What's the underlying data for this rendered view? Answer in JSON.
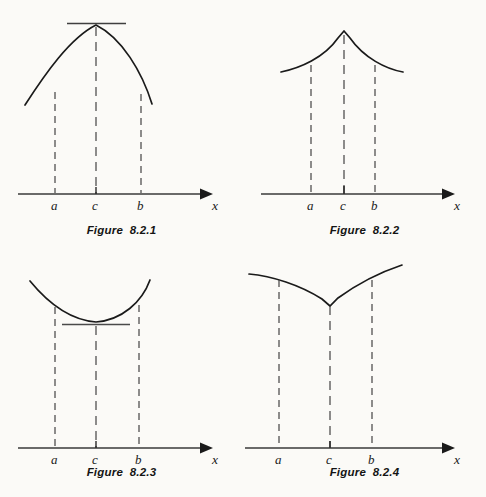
{
  "page": {
    "background_color": "#fbfaf7",
    "ink_color": "#1a1a1a",
    "width": 486,
    "height": 497,
    "kind": "textbook-figure-plate"
  },
  "figures": [
    {
      "id": "figure-8-2-1",
      "caption": "Figure  8.2.1",
      "description": "smooth curve with interior maximum at c, horizontal tangent line drawn at the maximum",
      "axis": {
        "y": 194,
        "x_start": 18,
        "x_end": 210,
        "arrow": true,
        "x_label": "x",
        "x_label_pos": {
          "x": 215,
          "y": 209
        }
      },
      "marks": [
        {
          "label": "a",
          "x": 55,
          "label_y": 209,
          "curve_y": 92,
          "dashed": true
        },
        {
          "label": "c",
          "x": 96,
          "label_y": 209,
          "curve_y": 25,
          "dashed": true
        },
        {
          "label": "b",
          "x": 141,
          "label_y": 209,
          "curve_y": 94,
          "dashed": true
        }
      ],
      "curve": {
        "type": "concave-down-parabola",
        "vertex": {
          "x": 96,
          "y": 25
        },
        "x_from": 25,
        "x_to": 152,
        "y_at_left_end": 105,
        "y_at_right_end": 104
      },
      "tangent": {
        "present": true,
        "y": 23,
        "x_from": 67,
        "x_to": 126,
        "orientation": "horizontal"
      }
    },
    {
      "id": "figure-8-2-2",
      "caption": "Figure  8.2.2",
      "description": "curve with a sharp upward cusp maximum at c, no tangent line",
      "axis": {
        "y": 194,
        "x_start": 261,
        "x_end": 452,
        "arrow": true,
        "x_label": "x",
        "x_label_pos": {
          "x": 457,
          "y": 209
        }
      },
      "marks": [
        {
          "label": "a",
          "x": 311,
          "label_y": 209,
          "curve_y": 65,
          "dashed": true
        },
        {
          "label": "c",
          "x": 344,
          "label_y": 209,
          "curve_y": 32,
          "dashed": true
        },
        {
          "label": "b",
          "x": 375,
          "label_y": 209,
          "curve_y": 65,
          "dashed": true
        }
      ],
      "curve": {
        "type": "upward-cusp",
        "vertex": {
          "x": 344,
          "y": 31
        },
        "x_from": 281,
        "x_to": 403,
        "y_at_left_end": 72,
        "y_at_right_end": 72
      },
      "tangent": {
        "present": false
      }
    },
    {
      "id": "figure-8-2-3",
      "caption": "Figure  8.2.3",
      "description": "smooth curve with interior minimum at c, horizontal tangent line drawn at the minimum",
      "axis": {
        "y": 448,
        "x_start": 18,
        "x_end": 210,
        "arrow": true,
        "x_label": "x",
        "x_label_pos": {
          "x": 215,
          "y": 463
        }
      },
      "marks": [
        {
          "label": "a",
          "x": 55,
          "label_y": 463,
          "curve_y": 307,
          "dashed": true
        },
        {
          "label": "c",
          "x": 96,
          "label_y": 463,
          "curve_y": 322,
          "dashed": true
        },
        {
          "label": "b",
          "x": 139,
          "label_y": 463,
          "curve_y": 305,
          "dashed": true
        }
      ],
      "curve": {
        "type": "concave-up-parabola",
        "vertex": {
          "x": 96,
          "y": 322
        },
        "x_from": 30,
        "x_to": 150,
        "y_at_left_end": 281,
        "y_at_right_end": 280
      },
      "tangent": {
        "present": true,
        "y": 324,
        "x_from": 62,
        "x_to": 130,
        "orientation": "horizontal"
      }
    },
    {
      "id": "figure-8-2-4",
      "caption": "Figure  8.2.4",
      "description": "curve with a sharp downward cusp minimum at c, no tangent line",
      "axis": {
        "y": 448,
        "x_start": 245,
        "x_end": 452,
        "arrow": true,
        "x_label": "x",
        "x_label_pos": {
          "x": 457,
          "y": 463
        }
      },
      "marks": [
        {
          "label": "a",
          "x": 279,
          "label_y": 463,
          "curve_y": 280,
          "dashed": true
        },
        {
          "label": "c",
          "x": 330,
          "label_y": 463,
          "curve_y": 306,
          "dashed": true
        },
        {
          "label": "b",
          "x": 372,
          "label_y": 463,
          "curve_y": 280,
          "dashed": true
        }
      ],
      "curve": {
        "type": "downward-cusp",
        "vertex": {
          "x": 330,
          "y": 306
        },
        "x_from": 249,
        "x_to": 402,
        "y_at_left_end": 274,
        "y_at_right_end": 265
      },
      "tangent": {
        "present": false
      }
    }
  ]
}
